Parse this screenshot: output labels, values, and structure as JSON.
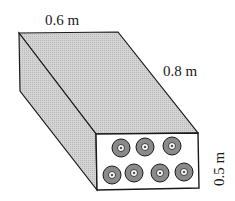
{
  "diagram": {
    "type": "rectangular duct with tubes (isometric box)",
    "labels": {
      "width": "0.6 m",
      "length": "0.8 m",
      "height": "0.5 m"
    },
    "tubes": {
      "top_row_count": 3,
      "bottom_row_count": 4
    },
    "colors": {
      "face_fill": "#cfcfcf",
      "front_fill": "#ffffff",
      "tube_outer": "#8a8a8a",
      "tube_inner": "#ffffff",
      "stroke": "#1a1a1a"
    }
  }
}
